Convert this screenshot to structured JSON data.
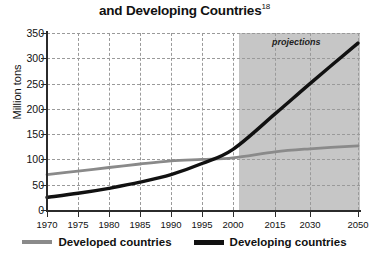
{
  "chart_data": {
    "type": "line",
    "title": "and Developing Countries",
    "title_superscript": "18",
    "xlabel": "",
    "ylabel": "Million tons",
    "ylim": [
      0,
      350
    ],
    "ytick_values": [
      0,
      50,
      100,
      150,
      200,
      250,
      300,
      350
    ],
    "ytick_labels": [
      "0",
      "50",
      "100",
      "150",
      "200",
      "250",
      "300",
      "350"
    ],
    "xtick_labels": [
      "1970",
      "1975",
      "1980",
      "1985",
      "1990",
      "1995",
      "2000",
      "2015",
      "2030",
      "2050"
    ],
    "xtick_values": [
      1970,
      1975,
      1980,
      1985,
      1990,
      1995,
      2000,
      2015,
      2030,
      2050
    ],
    "grid": true,
    "legend_position": "bottom",
    "annotations": [
      {
        "text": "projections",
        "x": 2024,
        "y": 335,
        "style": "italic"
      }
    ],
    "shaded_region": {
      "label": "projections",
      "x_start": 2002,
      "x_end": 2050,
      "color": "#c6c6c6"
    },
    "series": [
      {
        "name": "Developed countries",
        "color": "#8a8a8a",
        "x": [
          1970,
          1975,
          1980,
          1985,
          1990,
          1995,
          2000,
          2015,
          2030,
          2050
        ],
        "values": [
          70,
          77,
          84,
          91,
          97,
          100,
          103,
          115,
          121,
          127
        ]
      },
      {
        "name": "Developing countries",
        "color": "#111111",
        "x": [
          1970,
          1975,
          1980,
          1985,
          1990,
          1995,
          2000,
          2015,
          2030,
          2050
        ],
        "values": [
          25,
          33,
          43,
          55,
          70,
          92,
          120,
          190,
          250,
          330
        ]
      }
    ]
  },
  "legend": {
    "items": [
      {
        "label": "Developed countries",
        "color": "#8a8a8a"
      },
      {
        "label": "Developing countries",
        "color": "#111111"
      }
    ]
  }
}
